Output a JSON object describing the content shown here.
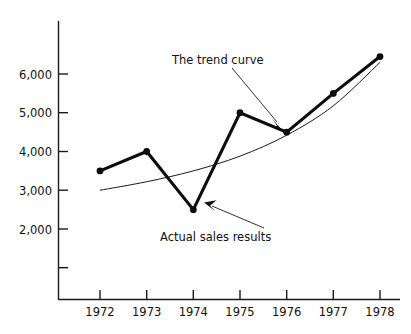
{
  "chart_data": {
    "type": "line",
    "title": "",
    "subtitle": "",
    "xlabel": "",
    "ylabel": "",
    "grid": false,
    "legend_position": "none",
    "categories": [
      "1972",
      "1973",
      "1974",
      "1975",
      "1976",
      "1977",
      "1978"
    ],
    "x": [
      1972,
      1973,
      1974,
      1975,
      1976,
      1977,
      1978
    ],
    "xlim": [
      1971.5,
      1978.5
    ],
    "ylim": [
      0,
      6800
    ],
    "xtick_labels": [
      "1972",
      "1973",
      "1974",
      "1975",
      "1976",
      "1977",
      "1978"
    ],
    "ytick_values": [
      1000,
      2000,
      3000,
      4000,
      5000,
      6000
    ],
    "ytick_labels": [
      "",
      "2,000",
      "3,000",
      "4,000",
      "5,000",
      "6,000"
    ],
    "series": [
      {
        "name": "Actual sales results",
        "style": "thick-line-with-markers",
        "values": [
          3500,
          4000,
          2500,
          5000,
          4500,
          5500,
          6450
        ]
      },
      {
        "name": "The trend curve",
        "style": "thin-smooth-curve",
        "values": [
          3000,
          3220,
          3500,
          3880,
          4420,
          5180,
          6300
        ]
      }
    ],
    "annotations": [
      {
        "id": "trend-curve-annotation",
        "text": "The trend curve",
        "points_to": "trend curve near 1976"
      },
      {
        "id": "actual-sales-annotation",
        "text": "Actual sales results",
        "points_to": "actual sales vertex at 1974"
      }
    ]
  },
  "axes": {
    "y_ticks": [
      {
        "label": "6,000",
        "value": 6000
      },
      {
        "label": "5,000",
        "value": 5000
      },
      {
        "label": "4,000",
        "value": 4000
      },
      {
        "label": "3,000",
        "value": 3000
      },
      {
        "label": "2,000",
        "value": 2000
      },
      {
        "label": "",
        "value": 1000
      }
    ],
    "x_ticks": [
      {
        "label": "1972"
      },
      {
        "label": "1973"
      },
      {
        "label": "1974"
      },
      {
        "label": "1975"
      },
      {
        "label": "1976"
      },
      {
        "label": "1977"
      },
      {
        "label": "1978"
      }
    ]
  },
  "annotations": {
    "trend_curve_label": "The trend curve",
    "actual_sales_label": "Actual sales results"
  },
  "colors": {
    "series_line": "#0d0d0d",
    "trend_line": "#1a1a1a",
    "axis": "#1a1a1a",
    "text": "#111111",
    "background": "#ffffff"
  }
}
